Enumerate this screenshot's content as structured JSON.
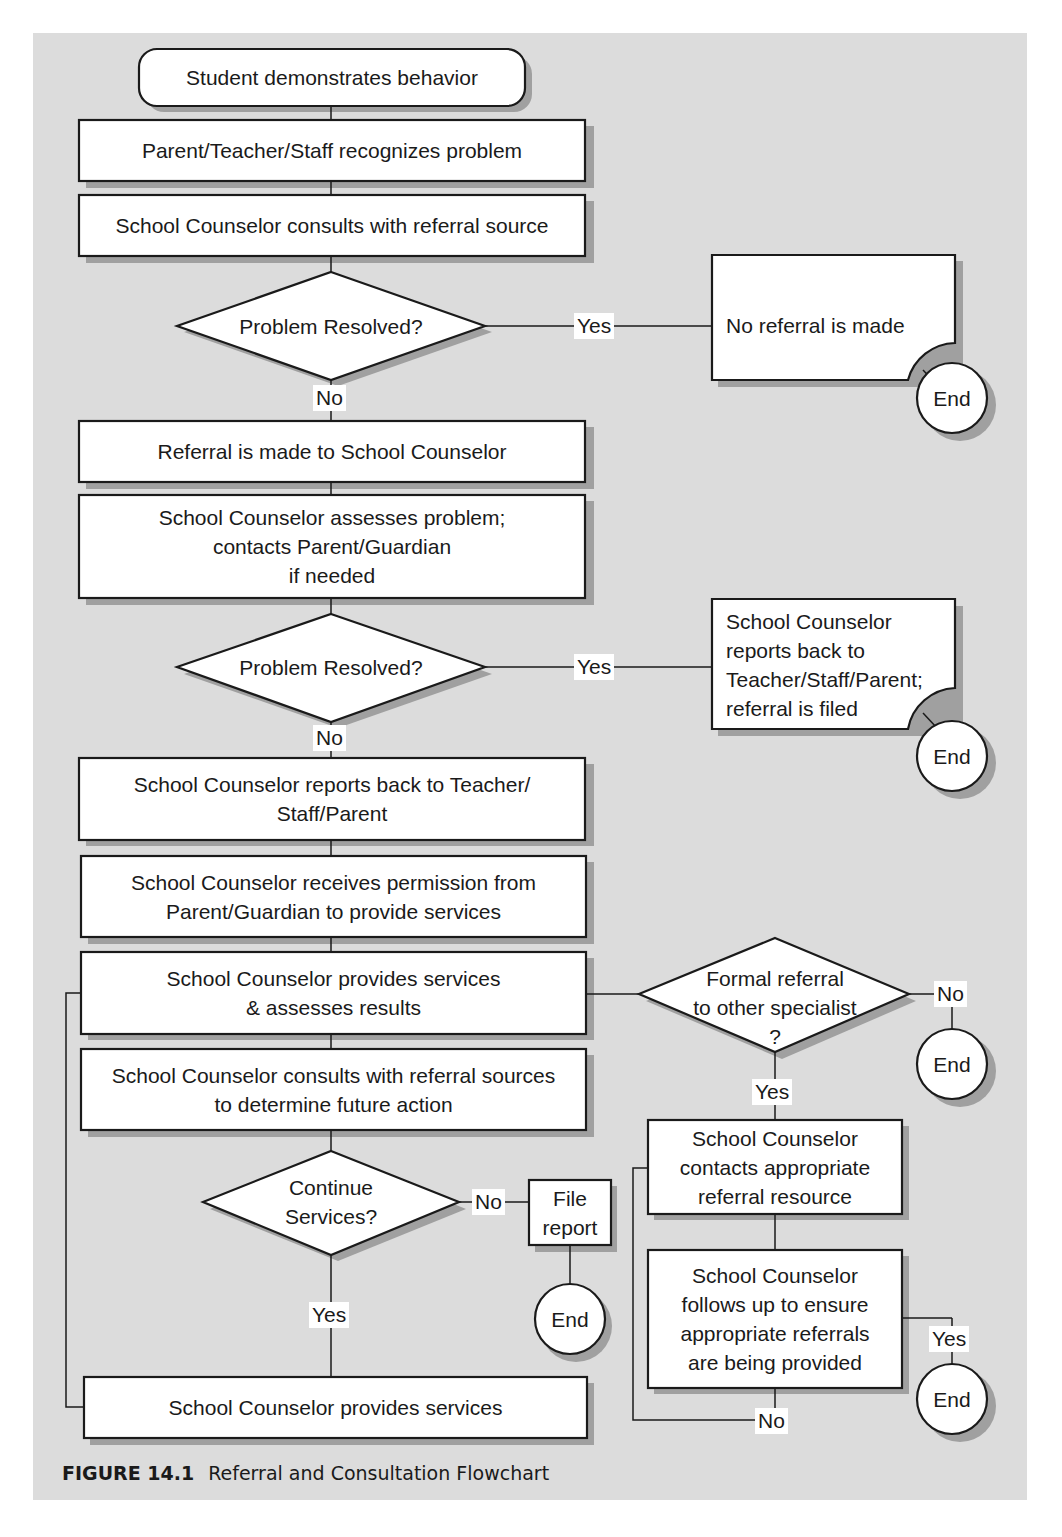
{
  "figure": {
    "label": "FIGURE 14.1",
    "title": "Referral and Consultation Flowchart"
  },
  "colors": {
    "panel_bg": "#dcdcdc",
    "box_fill": "#ffffff",
    "stroke": "#1a1a1a",
    "shadow": "#a0a0a0"
  },
  "nodes": {
    "start": "Student demonstrates behavior",
    "recognize": "Parent/Teacher/Staff recognizes problem",
    "consult_source": "School Counselor consults with referral source",
    "decision1": "Problem Resolved?",
    "no_referral": "No referral is made",
    "referral_made": "Referral is made to School Counselor",
    "assess": "School Counselor assesses problem;\ncontacts Parent/Guardian\nif needed",
    "decision2": "Problem Resolved?",
    "report_filed": "School Counselor\nreports back to\nTeacher/Staff/Parent;\nreferral is filed",
    "report_back": "School Counselor reports back to Teacher/\nStaff/Parent",
    "permission": "School Counselor receives permission from\nParent/Guardian to provide services",
    "provide_assess": "School Counselor provides services\n& assesses results",
    "decision_formal": "Formal referral\nto other specialist\n?",
    "consult_sources": "School Counselor consults with referral sources\nto determine future action",
    "decision_continue": "Continue\nServices?",
    "file_report": "File\nreport",
    "contacts_resource": "School Counselor\ncontacts appropriate\nreferral resource",
    "follow_up": "School Counselor\nfollows up to ensure\nappropriate referrals\nare being provided",
    "provide_services": "School Counselor provides services",
    "end": "End"
  },
  "edge_labels": {
    "yes": "Yes",
    "no": "No"
  }
}
